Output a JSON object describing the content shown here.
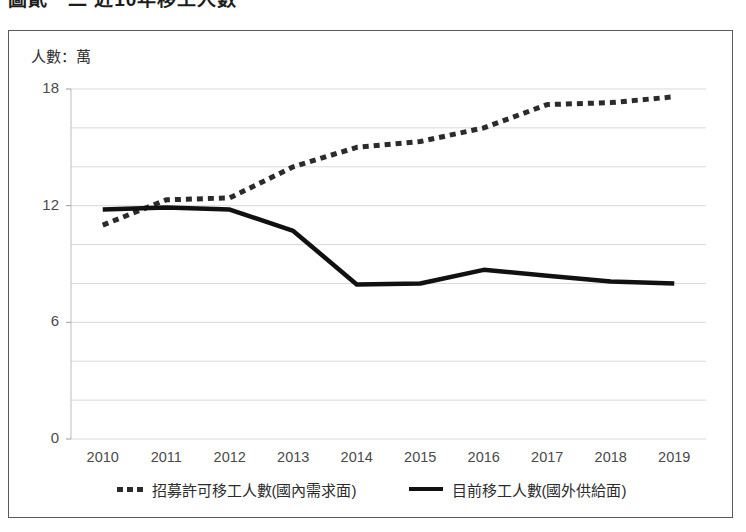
{
  "figure": {
    "title_partial": "圖貳－二 近10年移工人數"
  },
  "axis": {
    "unit_label": "人數：萬",
    "y_ticks": [
      "18",
      "12",
      "6",
      "0"
    ],
    "x_ticks": [
      "2010",
      "2011",
      "2012",
      "2013",
      "2014",
      "2015",
      "2016",
      "2017",
      "2018",
      "2019"
    ]
  },
  "legend": {
    "items": [
      {
        "label": "招募許可移工人數(國內需求面)",
        "style": "dotted",
        "color": "#2b2b2b"
      },
      {
        "label": "目前移工人數(國外供給面)",
        "style": "solid",
        "color": "#111111"
      }
    ]
  },
  "colors": {
    "demand_series": "#2b2b2b",
    "supply_series": "#111111",
    "gridline": "#d9d9d9",
    "frame": "#5a5a5a",
    "text": "#3b3b3b"
  },
  "chart_data": {
    "type": "line",
    "title": "圖貳－二 近10年移工人數",
    "xlabel": "",
    "ylabel": "人數：萬",
    "unit": "萬人",
    "grid": true,
    "legend_position": "bottom",
    "ylim": [
      0,
      18
    ],
    "ytick_interval_major": 6,
    "ytick_interval_minor": 2,
    "x": [
      "2010",
      "2011",
      "2012",
      "2013",
      "2014",
      "2015",
      "2016",
      "2017",
      "2018",
      "2019"
    ],
    "categories": [
      "2010",
      "2011",
      "2012",
      "2013",
      "2014",
      "2015",
      "2016",
      "2017",
      "2018",
      "2019"
    ],
    "series": [
      {
        "name": "招募許可移工人數(國內需求面)",
        "style": "dotted",
        "color": "#2b2b2b",
        "values": [
          11.0,
          12.3,
          12.4,
          14.0,
          15.0,
          15.3,
          16.0,
          17.2,
          17.3,
          17.6
        ]
      },
      {
        "name": "目前移工人數(國外供給面)",
        "style": "solid",
        "color": "#111111",
        "values": [
          11.8,
          11.9,
          11.8,
          10.7,
          7.95,
          8.0,
          8.7,
          8.4,
          8.1,
          8.0
        ]
      }
    ]
  }
}
